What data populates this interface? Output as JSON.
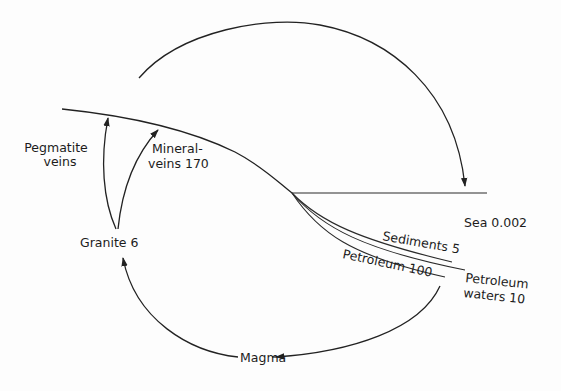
{
  "diagram": {
    "type": "geochemical cycle diagram",
    "colors": {
      "ink": "#222222",
      "background": "#fdfdfd"
    },
    "labels": {
      "pegmatite_line1": "Pegmatite",
      "pegmatite_line2": "veins",
      "mineral_line1": "Mineral-",
      "mineral_line2": "veins 170",
      "granite": "Granite 6",
      "sea": "Sea 0.002",
      "sediments": "Sediments 5",
      "petroleum": "Petroleum 100",
      "petroleum_waters_line1": "Petroleum",
      "petroleum_waters_line2": "waters 10",
      "magma": "Magma"
    },
    "nodes": [
      {
        "id": "granite",
        "label": "Granite 6",
        "value": 6
      },
      {
        "id": "pegmatite_veins",
        "label": "Pegmatite veins"
      },
      {
        "id": "mineral_veins",
        "label": "Mineral-veins 170",
        "value": 170
      },
      {
        "id": "sea",
        "label": "Sea 0.002",
        "value": 0.002
      },
      {
        "id": "sediments",
        "label": "Sediments 5",
        "value": 5
      },
      {
        "id": "petroleum",
        "label": "Petroleum 100",
        "value": 100
      },
      {
        "id": "petroleum_waters",
        "label": "Petroleum waters 10",
        "value": 10
      },
      {
        "id": "magma",
        "label": "Magma"
      }
    ],
    "arrows": [
      {
        "from": "granite",
        "to": "pegmatite_veins"
      },
      {
        "from": "granite",
        "to": "mineral_veins"
      },
      {
        "from": "land_surface",
        "to": "sea"
      },
      {
        "from": "petroleum",
        "to": "magma"
      },
      {
        "from": "magma",
        "to": "granite"
      }
    ]
  }
}
